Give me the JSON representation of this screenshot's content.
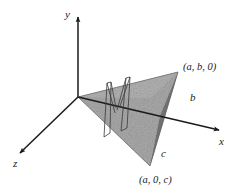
{
  "figure": {
    "background_color": "#ffffff",
    "ink_color": "#1a1a1a",
    "face_front_color": "#a9a9a9",
    "face_right_color": "#767676",
    "face_top_color": "#b8b8b8"
  },
  "axes": {
    "y": {
      "label": "y",
      "direction": "up"
    },
    "x": {
      "label": "x",
      "direction": "right-down"
    },
    "z": {
      "label": "z",
      "direction": "left-down"
    }
  },
  "points": {
    "vertex_top_right": {
      "label": "(a, b, 0)"
    },
    "vertex_bottom": {
      "label": "(a, 0, c)"
    }
  },
  "segments": {
    "b": {
      "label": "b"
    },
    "c": {
      "label": "c"
    }
  }
}
